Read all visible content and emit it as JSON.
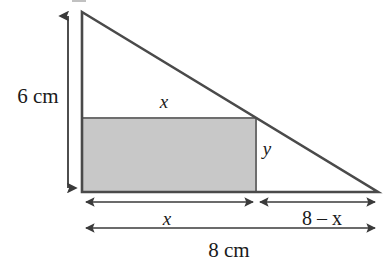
{
  "figure": {
    "name": "right-triangle-with-inscribed-rectangle",
    "background_color": "#ffffff",
    "stroke_color": "#4a4a4a",
    "rect_fill_color": "#c8c8c8",
    "rect_border_color": "#6e6e6e",
    "text_color": "#1a1a1a",
    "labels": {
      "height_label": "6 cm",
      "rect_top_label": "x",
      "rect_right_label": "y",
      "base_left_label": "x",
      "base_right_label": "8 – x",
      "base_total_label": "8 cm"
    },
    "geometry": {
      "triangle_apex": [
        82,
        12
      ],
      "triangle_bottom_left": [
        82,
        192
      ],
      "triangle_bottom_right": [
        378,
        192
      ],
      "rectangle_top_left": [
        82,
        118
      ],
      "rectangle_bottom_right": [
        256,
        192
      ],
      "height_dimension_line_x": 68,
      "height_dimension_top_y": 12,
      "height_dimension_bottom_y": 192,
      "base_dimension_line_y": 202,
      "total_dimension_line_y": 228
    },
    "values": {
      "triangle_height_cm": 6,
      "triangle_base_cm": 8,
      "rectangle_width": "x",
      "rectangle_height": "y",
      "remaining_base": "8 - x"
    }
  }
}
